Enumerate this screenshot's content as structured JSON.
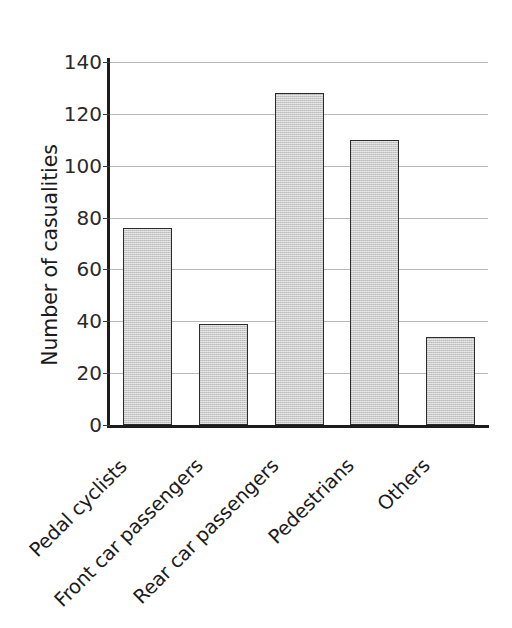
{
  "chart_data": {
    "type": "bar",
    "title": "",
    "xlabel": "",
    "ylabel": "Number of casualities",
    "categories": [
      "Pedal cyclists",
      "Front car passengers",
      "Rear car passengers",
      "Pedestrians",
      "Others"
    ],
    "values": [
      76,
      39,
      128,
      110,
      34
    ],
    "ylim": [
      0,
      140
    ],
    "ytick_labels": [
      "0",
      "20",
      "40",
      "60",
      "80",
      "100",
      "120",
      "140"
    ],
    "ytick_values": [
      0,
      20,
      40,
      60,
      80,
      100,
      120,
      140
    ],
    "grid": "horizontal",
    "legend": "none",
    "bar_fill_color": "#cbcbcb",
    "bar_edge_color": "#2b2b2b",
    "gridline_color": "#b9b9b9",
    "axis_color": "#1c1c1c",
    "xlabel_rotation_deg": -45
  }
}
